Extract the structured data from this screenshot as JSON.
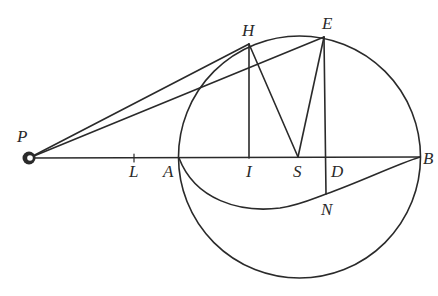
{
  "figure": {
    "type": "geometric-diagram",
    "stroke_color": "#2a2a2a",
    "background": "#ffffff"
  },
  "points": {
    "P": {
      "label": "P",
      "x": 29,
      "y": 158
    },
    "L": {
      "label": "L",
      "x": 134,
      "y": 158
    },
    "A": {
      "label": "A",
      "x": 179,
      "y": 158
    },
    "I": {
      "label": "I",
      "x": 249,
      "y": 158
    },
    "S": {
      "label": "S",
      "x": 298,
      "y": 158
    },
    "D": {
      "label": "D",
      "x": 326,
      "y": 158
    },
    "B": {
      "label": "B",
      "x": 420,
      "y": 157
    },
    "H": {
      "label": "H",
      "x": 249,
      "y": 44
    },
    "E": {
      "label": "E",
      "x": 324,
      "y": 37
    },
    "N": {
      "label": "N",
      "x": 326,
      "y": 194
    }
  },
  "circle": {
    "cx": 299.5,
    "cy": 157,
    "r": 121
  },
  "labels": {
    "P": "P",
    "L": "L",
    "A": "A",
    "I": "I",
    "S": "S",
    "D": "D",
    "B": "B",
    "H": "H",
    "E": "E",
    "N": "N"
  }
}
